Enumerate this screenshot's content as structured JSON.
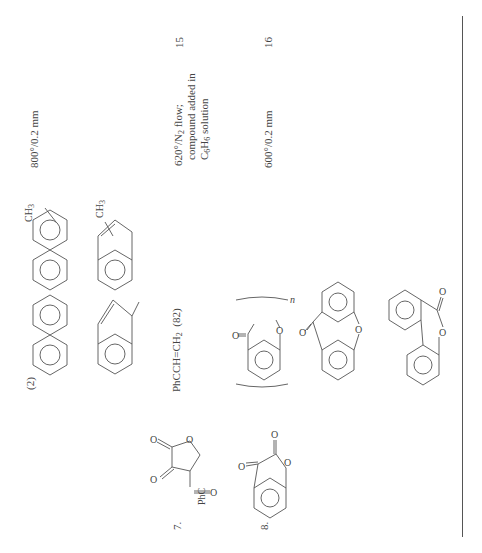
{
  "page": {
    "orientation": "rotated-90-ccw",
    "rows": [
      {
        "entry": "(2)",
        "products": [
          "naphthalene",
          "methylnaphthalene",
          "1-methyleneindene (benzofulvene)",
          "methylindene"
        ],
        "product_labels": [
          "CH3",
          "CH3"
        ],
        "conditions": "800°/0.2 mm",
        "reference": ""
      },
      {
        "entry": "7.",
        "reactant": "3-benzoyl-furan-2,3-dione (PhC=O)",
        "reactant_label": "PhC",
        "products_text": "PhCCH=CH2 (82)",
        "products_text_parts": {
          "main": "PhCCH",
          "eq": "=",
          "ch2": "CH",
          "sub": "2",
          "yield": "(82)",
          "carbonyl": "O"
        },
        "conditions_lines": [
          "620°/N2 flow;",
          "compound added in",
          "C6H6 solution"
        ],
        "reference": "15"
      },
      {
        "entry": "8.",
        "reactant": "benzofuran-2,3-dione",
        "products": [
          "polymer (n)",
          "xanthone",
          "6H-benzo[c]chromen-6-one"
        ],
        "polymer_subscript": "n",
        "conditions": "600°/0.2 mm",
        "reference": "16"
      }
    ]
  }
}
